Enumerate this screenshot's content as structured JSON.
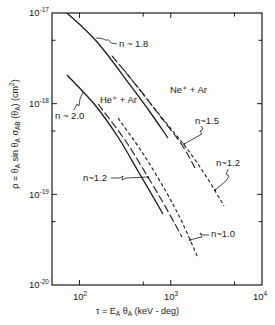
{
  "chart_data": {
    "type": "line",
    "title": "",
    "xlabel": "τ = E_A θ_A (keV - deg)",
    "ylabel": "ρ = θ_A sin θ_A σ_AB (θ_A) (cm²)",
    "xlabel_parts": [
      {
        "text": "τ = E",
        "kind": "normal"
      },
      {
        "text": "A",
        "kind": "sub"
      },
      {
        "text": " θ",
        "kind": "normal"
      },
      {
        "text": "A",
        "kind": "sub"
      },
      {
        "text": " (keV - deg)",
        "kind": "normal"
      }
    ],
    "ylabel_parts": [
      {
        "text": "ρ = θ",
        "kind": "normal"
      },
      {
        "text": "A",
        "kind": "sub"
      },
      {
        "text": " sin θ",
        "kind": "normal"
      },
      {
        "text": "A",
        "kind": "sub"
      },
      {
        "text": " σ",
        "kind": "normal"
      },
      {
        "text": "AB",
        "kind": "sub"
      },
      {
        "text": " (θ",
        "kind": "normal"
      },
      {
        "text": "A",
        "kind": "sub"
      },
      {
        "text": ") (cm",
        "kind": "normal"
      },
      {
        "text": "2",
        "kind": "sup"
      },
      {
        "text": ")",
        "kind": "normal"
      }
    ],
    "xscale": "log",
    "yscale": "log",
    "xlim": [
      50,
      10000
    ],
    "ylim": [
      1e-20,
      1e-17
    ],
    "x_major_ticks": [
      100,
      1000,
      10000
    ],
    "x_minor_ticks": [
      500,
      5000
    ],
    "y_major_ticks": [
      1e-17,
      1e-18,
      1e-19,
      1e-20
    ],
    "y_minor_ticks": [
      5e-18,
      5e-19,
      5e-20
    ],
    "x_tick_labels": [
      {
        "base": "10",
        "exp": "2"
      },
      {
        "base": "10",
        "exp": "3"
      },
      {
        "base": "10",
        "exp": "4"
      }
    ],
    "y_tick_labels": [
      {
        "base": "10",
        "exp": "-17"
      },
      {
        "base": "10",
        "exp": "-18"
      },
      {
        "base": "10",
        "exp": "-19"
      },
      {
        "base": "10",
        "exp": "-20"
      }
    ],
    "grid": false,
    "legend": null,
    "series": [
      {
        "name": "Ne+ + Ar",
        "curves": [
          {
            "id": "ne-ar-solid",
            "label": "n ~ 1.8",
            "style": "solid",
            "points": [
              [
                73,
                1e-17
              ],
              [
                156,
                4.79e-18
              ],
              [
                358,
                1.61e-18
              ],
              [
                593,
                8.09e-19
              ],
              [
                933,
                4.18e-19
              ]
            ]
          },
          {
            "id": "ne-ar-long-dash",
            "label": "n~1.5",
            "style": "long-dash",
            "points": [
              [
                227,
                3.36e-18
              ],
              [
                461,
                1.42e-18
              ],
              [
                763,
                7.31e-19
              ],
              [
                1329,
                3.5e-19
              ],
              [
                1844,
                1.95e-19
              ]
            ]
          },
          {
            "id": "ne-ar-short-dash",
            "label": "n~1.2",
            "style": "short-dash",
            "points": [
              [
                308,
                2.35e-18
              ],
              [
                593,
                1.02e-18
              ],
              [
                1032,
                5.12e-19
              ],
              [
                1546,
                3.08e-19
              ],
              [
                2434,
                1.59e-19
              ],
              [
                3833,
                7.43e-20
              ]
            ]
          }
        ]
      },
      {
        "name": "He+ + Ar",
        "curves": [
          {
            "id": "he-ar-solid",
            "label": "n ~ 2.0",
            "style": "solid",
            "points": [
              [
                73,
                2.07e-18
              ],
              [
                148,
                9.66e-19
              ],
              [
                264,
                4.29e-19
              ],
              [
                438,
                1.81e-19
              ],
              [
                823,
                6.07e-20
              ]
            ]
          },
          {
            "id": "he-ar-long-dash",
            "label": "n~1.2",
            "style": "long-dash",
            "points": [
              [
                160,
                9.91e-19
              ],
              [
                315,
                3.97e-19
              ],
              [
                564,
                1.55e-19
              ],
              [
                865,
                7.43e-20
              ],
              [
                1329,
                3.38e-20
              ]
            ]
          },
          {
            "id": "he-ar-short-dash",
            "label": "n~1.0",
            "style": "short-dash",
            "points": [
              [
                264,
                6.95e-19
              ],
              [
                484,
                2.93e-19
              ],
              [
                865,
                1.12e-19
              ],
              [
                1329,
                4.95e-20
              ],
              [
                1989,
                1.99e-20
              ]
            ]
          }
        ]
      }
    ],
    "annotations": [
      {
        "text": "n ~ 1.8",
        "refers_to": "Ne+ + Ar solid"
      },
      {
        "text": "Ne⁺ + Ar"
      },
      {
        "text": "He⁺ + Ar"
      },
      {
        "text": "n ~ 2.0",
        "refers_to": "He+ + Ar solid"
      },
      {
        "text": "n~1.5",
        "refers_to": "Ne+ + Ar long-dash"
      },
      {
        "text": "n~1.2",
        "refers_to": "Ne+ + Ar short-dash"
      },
      {
        "text": "n~1.2",
        "refers_to": "He+ + Ar long-dash"
      },
      {
        "text": "n~1.0",
        "refers_to": "He+ + Ar short-dash"
      }
    ],
    "line_color": "#1c1c1c"
  }
}
